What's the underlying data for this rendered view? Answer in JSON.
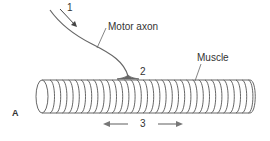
{
  "figure": {
    "panel_label": "A",
    "labels": {
      "step1": "1",
      "motor_axon": "Motor axon",
      "step2": "2",
      "muscle": "Muscle",
      "step3": "3"
    },
    "colors": {
      "line": "#555555",
      "text": "#333333",
      "background": "#ffffff"
    }
  }
}
